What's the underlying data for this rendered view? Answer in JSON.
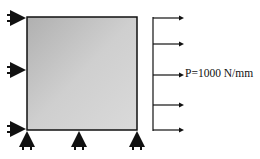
{
  "diagram": {
    "type": "structural-load-diagram",
    "load_label": "P=1000 N/mm",
    "colors": {
      "plate_fill_light": "#d6d6d6",
      "plate_fill_dark": "#a8a8a8",
      "stroke": "#111111"
    },
    "left_supports": [
      {
        "y": 18
      },
      {
        "y": 70
      },
      {
        "y": 129
      }
    ],
    "bottom_supports": [
      {
        "x": 27
      },
      {
        "x": 79
      },
      {
        "x": 137
      }
    ],
    "load_arrows_y": [
      18,
      44,
      75,
      105,
      130
    ]
  }
}
